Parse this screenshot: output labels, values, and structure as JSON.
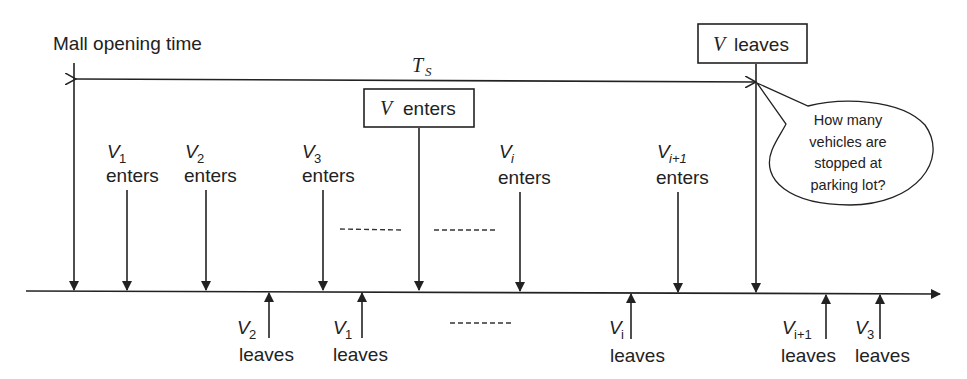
{
  "diagram": {
    "title_label": "Mall opening time",
    "span_label": {
      "main": "T",
      "sub": "S"
    },
    "boxes": {
      "v_enters": {
        "var": "V",
        "text": "enters"
      },
      "v_leaves": {
        "var": "V",
        "text": "leaves"
      }
    },
    "callout": {
      "lines": [
        "How many",
        "vehicles are",
        "stopped at",
        "parking lot?"
      ]
    },
    "enter_events": [
      {
        "var": "V",
        "sub": "1",
        "text": "enters"
      },
      {
        "var": "V",
        "sub": "2",
        "text": "enters"
      },
      {
        "var": "V",
        "sub": "3",
        "text": "enters"
      },
      {
        "var": "V",
        "sub": "i",
        "text": "enters"
      },
      {
        "var": "V",
        "sub": "i+1",
        "text": "enters"
      }
    ],
    "leave_events": [
      {
        "var": "V",
        "sub": "2",
        "text": "leaves"
      },
      {
        "var": "V",
        "sub": "1",
        "text": "leaves"
      },
      {
        "var": "V",
        "sub": "i",
        "text": "leaves"
      },
      {
        "var": "V",
        "sub": "i+1",
        "text": "leaves"
      },
      {
        "var": "V",
        "sub": "3",
        "text": "leaves"
      }
    ],
    "ellipsis": "---------"
  }
}
